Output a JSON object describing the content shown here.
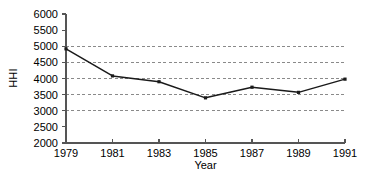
{
  "chart_data": {
    "type": "line",
    "title": "",
    "xlabel": "Year",
    "ylabel": "HHI",
    "x": [
      1979,
      1981,
      1983,
      1985,
      1987,
      1989,
      1991
    ],
    "values": [
      4920,
      4080,
      3900,
      3400,
      3730,
      3570,
      3980
    ],
    "series": [
      {
        "name": "HHI",
        "values": [
          4920,
          4080,
          3900,
          3400,
          3730,
          3570,
          3980
        ]
      }
    ],
    "xlim": [
      1979,
      1991
    ],
    "ylim": [
      2000,
      6000
    ],
    "x_tick_labels": [
      "1979",
      "1981",
      "1983",
      "1985",
      "1987",
      "1989",
      "1991"
    ],
    "y_ticks": [
      2000,
      2500,
      3000,
      3500,
      4000,
      4500,
      5000,
      5500,
      6000
    ],
    "y_tick_labels": [
      "2000",
      "2500",
      "3000",
      "3500",
      "4000",
      "4500",
      "5000",
      "5500",
      "6000"
    ],
    "gridlines": [
      3000,
      3500,
      4000,
      4500,
      5000
    ],
    "grid": "horizontal-dashed",
    "legend": "none",
    "line_color": "#1a1a1a",
    "marker": "square",
    "marker_color": "#1a1a1a",
    "axis_color": "#555555",
    "grid_color": "#8a8a8a",
    "background": "#ffffff"
  }
}
